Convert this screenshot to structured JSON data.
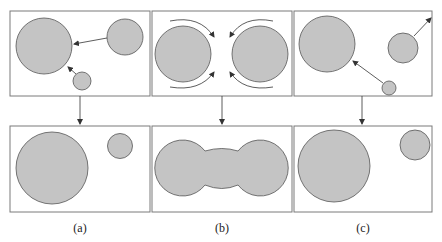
{
  "diagram": {
    "type": "process-schematic",
    "colors": {
      "particle_fill": "#c4c4c4",
      "particle_stroke": "#555555",
      "frame_stroke": "#7a7a7a",
      "arrow": "#333333"
    },
    "panels": [
      {
        "label": "(a)",
        "top": {
          "circles": [
            {
              "cx": 42,
              "cy": 46,
              "r": 28
            },
            {
              "cx": 125,
              "cy": 37,
              "r": 18
            },
            {
              "cx": 82,
              "cy": 80,
              "r": 9
            }
          ],
          "arrows": [
            "small-right to large",
            "tiny to large"
          ]
        },
        "bottom": {
          "circles": [
            {
              "cx": 52,
              "cy": 168,
              "r": 36
            },
            {
              "cx": 120,
              "cy": 146,
              "r": 12
            }
          ]
        }
      },
      {
        "label": "(b)",
        "top": {
          "circles": [
            {
              "cx": 183,
              "cy": 53,
              "r": 28
            },
            {
              "cx": 260,
              "cy": 53,
              "r": 28
            }
          ],
          "arrows": [
            "curved rotation arrows around each circle"
          ]
        },
        "bottom": {
          "shape": "merged-dumbbell"
        }
      },
      {
        "label": "(c)",
        "top": {
          "circles": [
            {
              "cx": 327,
              "cy": 43,
              "r": 28
            },
            {
              "cx": 403,
              "cy": 48,
              "r": 15
            },
            {
              "cx": 389,
              "cy": 88,
              "r": 7
            }
          ],
          "arrows": [
            "tiny to large",
            "medium outward"
          ]
        },
        "bottom": {
          "circles": [
            {
              "cx": 334,
              "cy": 166,
              "r": 36
            },
            {
              "cx": 415,
              "cy": 145,
              "r": 15
            }
          ]
        }
      }
    ]
  },
  "labels": {
    "a": "(a)",
    "b": "(b)",
    "c": "(c)"
  }
}
